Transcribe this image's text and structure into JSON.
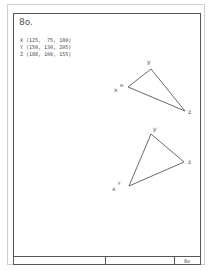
{
  "sheet": {
    "title": "8o.",
    "coordinates": [
      {
        "label": "X",
        "value": "(125,  75, 180)"
      },
      {
        "label": "Y",
        "value": "(150, 130, 205)"
      },
      {
        "label": "Z",
        "value": "(188, 100, 155)"
      }
    ]
  },
  "views": {
    "top": {
      "vertices": {
        "x": "x",
        "x_sup": "H",
        "y": "y",
        "z": "z"
      }
    },
    "front": {
      "vertices": {
        "x": "x",
        "x_sup": "F",
        "y": "y",
        "z": "z"
      }
    }
  },
  "title_block": {
    "sheet_number": "8o"
  }
}
